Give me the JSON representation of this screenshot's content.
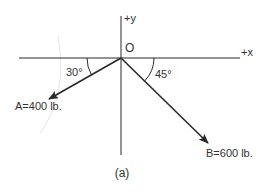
{
  "diagram": {
    "caption": "(a)",
    "origin_label": "O",
    "axes": {
      "x_label": "+x",
      "y_label": "+y"
    },
    "forces": [
      {
        "name": "A",
        "label": "A=400 lb.",
        "magnitude": 400,
        "unit": "lb.",
        "angle_label": "30°",
        "angle_deg": 30,
        "reference": "negative x-axis, below"
      },
      {
        "name": "B",
        "label": "B=600 lb.",
        "magnitude": 600,
        "unit": "lb.",
        "angle_label": "45°",
        "angle_deg": 45,
        "reference": "positive x-axis, below"
      }
    ],
    "colors": {
      "line": "#2a2a2a",
      "text": "#333333",
      "background": "#ffffff"
    }
  }
}
